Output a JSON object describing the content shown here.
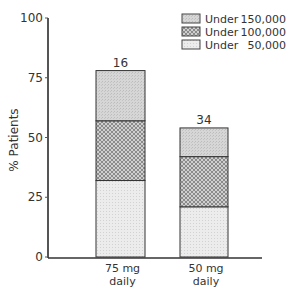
{
  "chart_data": {
    "type": "bar",
    "stacked": true,
    "title": "",
    "xlabel": "",
    "ylabel": "% Patients",
    "ylim": [
      0,
      100
    ],
    "yticks": [
      0,
      25,
      50,
      75,
      100
    ],
    "categories": [
      "75 mg daily",
      "50 mg daily"
    ],
    "category_lines": [
      [
        "75 mg",
        "daily"
      ],
      [
        "50 mg",
        "daily"
      ]
    ],
    "bar_top_labels": [
      "16",
      "34"
    ],
    "series": [
      {
        "name": "Under 50,000",
        "values": [
          32,
          21
        ],
        "pattern": "light-stipple"
      },
      {
        "name": "Under 100,000",
        "values": [
          57,
          42
        ],
        "pattern": "crosshatch"
      },
      {
        "name": "Under 150,000",
        "values": [
          78,
          54
        ],
        "pattern": "gray-stipple"
      }
    ],
    "cumulative": true,
    "legend": {
      "position": "upper-right",
      "entries": [
        {
          "label": "Under",
          "value": "150,000",
          "pattern": "gray-stipple"
        },
        {
          "label": "Under",
          "value": "100,000",
          "pattern": "crosshatch"
        },
        {
          "label": "Under",
          "value": "50,000",
          "pattern": "light-stipple"
        }
      ]
    },
    "grid": false
  }
}
